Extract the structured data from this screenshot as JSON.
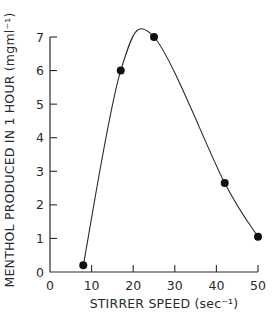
{
  "chart_data": {
    "type": "line",
    "title": "",
    "xlabel": "STIRRER SPEED (sec⁻¹)",
    "ylabel": "MENTHOL PRODUCED IN 1 HOUR (mgml⁻¹)",
    "xlim": [
      0,
      50
    ],
    "ylim": [
      0,
      7
    ],
    "xticks": [
      0,
      10,
      20,
      30,
      40,
      50
    ],
    "yticks": [
      0,
      1,
      2,
      3,
      4,
      5,
      6,
      7
    ],
    "grid": false,
    "legend": null,
    "smooth_curve": true,
    "series": [
      {
        "name": "Menthol produced",
        "marker": "filled-circle",
        "x": [
          8,
          17,
          25,
          42,
          50
        ],
        "y": [
          0.2,
          6.0,
          7.0,
          2.65,
          1.05
        ]
      }
    ]
  },
  "labels": {
    "xlabel": "STIRRER SPEED (sec⁻¹)",
    "ylabel": "MENTHOL PRODUCED IN 1 HOUR (mgml⁻¹)"
  }
}
